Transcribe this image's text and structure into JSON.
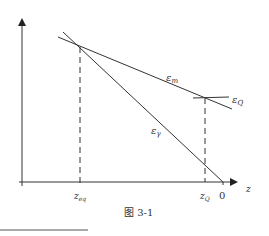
{
  "figure": {
    "caption": "图 3-1",
    "axes": {
      "x_label": "z",
      "y_label": ""
    },
    "x_ticks": {
      "z_eq": {
        "base": "z",
        "sub": "eq"
      },
      "z_Q": {
        "base": "z",
        "sub": "Q"
      },
      "zero": "0"
    },
    "curves": {
      "eps_m": {
        "base": "ε",
        "sub": "m"
      },
      "eps_Q": {
        "base": "ε",
        "sub": "Q"
      },
      "eps_gamma": {
        "base": "ε",
        "sub": "γ"
      }
    },
    "colors": {
      "line": "#333333",
      "background": "#ffffff"
    }
  }
}
